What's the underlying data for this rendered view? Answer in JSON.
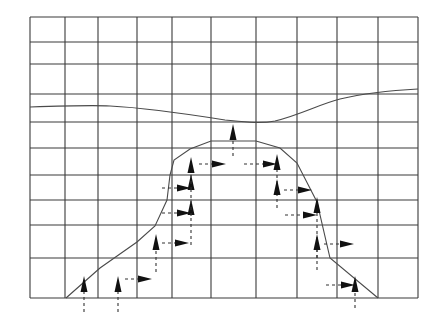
{
  "diagram": {
    "colors": {
      "grid": "#3a3a3a",
      "curve": "#4a4a4a",
      "arrow": "#111111",
      "background": "#ffffff"
    },
    "grid": {
      "vertical_x": [
        30,
        65,
        98,
        137,
        172,
        211,
        256,
        297,
        337,
        378,
        418
      ],
      "horizontal_y": [
        17,
        42,
        64,
        94,
        122,
        148,
        175,
        200,
        225,
        258,
        298
      ]
    },
    "upper_curve": "M30,107 C60,106 90,105 110,106 C150,108 200,116 225,120 C245,122 260,124 275,121 C300,115 320,104 340,99 C370,92 400,90 418,89",
    "lower_profile": [
      [
        66,
        298
      ],
      [
        100,
        268
      ],
      [
        137,
        242
      ],
      [
        155,
        226
      ],
      [
        167,
        200
      ],
      [
        170,
        175
      ],
      [
        174,
        160
      ],
      [
        190,
        149
      ],
      [
        211,
        141
      ],
      [
        256,
        141
      ],
      [
        280,
        148
      ],
      [
        297,
        163
      ],
      [
        317,
        202
      ],
      [
        330,
        258
      ],
      [
        378,
        298
      ]
    ],
    "up_arrows": [
      {
        "x": 84,
        "y1": 312,
        "y2": 282
      },
      {
        "x": 118,
        "y1": 312,
        "y2": 282
      },
      {
        "x": 156,
        "y1": 272,
        "y2": 240
      },
      {
        "x": 191,
        "y1": 245,
        "y2": 205
      },
      {
        "x": 191,
        "y1": 216,
        "y2": 180
      },
      {
        "x": 191,
        "y1": 190,
        "y2": 163
      },
      {
        "x": 233,
        "y1": 156,
        "y2": 130
      },
      {
        "x": 277,
        "y1": 208,
        "y2": 160
      },
      {
        "x": 277,
        "y1": 185,
        "y2": 185
      },
      {
        "x": 317,
        "y1": 258,
        "y2": 203
      },
      {
        "x": 317,
        "y1": 270,
        "y2": 240
      },
      {
        "x": 355,
        "y1": 308,
        "y2": 282
      }
    ],
    "right_arrows": [
      {
        "y": 279,
        "x1": 125,
        "x2": 152
      },
      {
        "y": 243,
        "x1": 162,
        "x2": 189
      },
      {
        "y": 213,
        "x1": 162,
        "x2": 191
      },
      {
        "y": 188,
        "x1": 162,
        "x2": 191
      },
      {
        "y": 164,
        "x1": 199,
        "x2": 226
      },
      {
        "y": 164,
        "x1": 244,
        "x2": 277
      },
      {
        "y": 190,
        "x1": 284,
        "x2": 312
      },
      {
        "y": 215,
        "x1": 285,
        "x2": 317
      },
      {
        "y": 244,
        "x1": 324,
        "x2": 354
      },
      {
        "y": 285,
        "x1": 326,
        "x2": 355
      }
    ]
  }
}
